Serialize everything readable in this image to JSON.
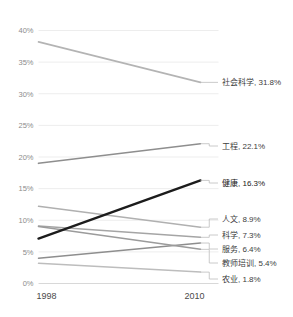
{
  "chart_data": {
    "type": "line",
    "subtype": "slope",
    "title": "",
    "subtitle": "",
    "xlabel": "",
    "ylabel": "",
    "x": [
      "1998",
      "2010"
    ],
    "categories": [
      "1998",
      "2010"
    ],
    "ylim": [
      0,
      40
    ],
    "grid": true,
    "legend_position": "right-labels",
    "y_ticks": [
      {
        "value": 40,
        "label": "40%"
      },
      {
        "value": 35,
        "label": "35%"
      },
      {
        "value": 30,
        "label": "30%"
      },
      {
        "value": 25,
        "label": "25%"
      },
      {
        "value": 20,
        "label": "20%"
      },
      {
        "value": 15,
        "label": "15%"
      },
      {
        "value": 10,
        "label": "10%"
      },
      {
        "value": 5,
        "label": "5%"
      },
      {
        "value": 0,
        "label": "0%"
      }
    ],
    "x_ticks": [
      {
        "label": "1998"
      },
      {
        "label": "2010"
      }
    ],
    "series": [
      {
        "name": "社会科学",
        "values": [
          38.2,
          31.8
        ],
        "end_label": "社会科学, 31.8%",
        "end_value_label": "31.8%",
        "color": "#b4b4b4",
        "width": 1.6,
        "highlight": false,
        "label_y": 82
      },
      {
        "name": "工程",
        "values": [
          19.0,
          22.1
        ],
        "end_label": "工程, 22.1%",
        "end_value_label": "22.1%",
        "color": "#8e8e8e",
        "width": 1.6,
        "highlight": false,
        "label_y": 146
      },
      {
        "name": "健康",
        "values": [
          7.1,
          16.3
        ],
        "end_label": "健康, 16.3%",
        "end_value_label": "16.3%",
        "color": "#1c1c1c",
        "width": 2.4,
        "highlight": true,
        "label_y": 183
      },
      {
        "name": "人文",
        "values": [
          12.2,
          8.9
        ],
        "end_label": "人文, 8.9%",
        "end_value_label": "8.9%",
        "color": "#b0b0b0",
        "width": 1.5,
        "highlight": false,
        "label_y": 219
      },
      {
        "name": "科学",
        "values": [
          9.1,
          7.3
        ],
        "end_label": "科学, 7.3%",
        "end_value_label": "7.3%",
        "color": "#a5a5a5",
        "width": 1.5,
        "highlight": false,
        "label_y": 235
      },
      {
        "name": "服务",
        "values": [
          4.0,
          6.4
        ],
        "end_label": "服务, 6.4%",
        "end_value_label": "6.4%",
        "color": "#8e8e8e",
        "width": 1.5,
        "highlight": false,
        "label_y": 249
      },
      {
        "name": "教师培训",
        "values": [
          9.0,
          5.4
        ],
        "end_label": "教师培训, 5.4%",
        "end_value_label": "5.4%",
        "color": "#9b9b9b",
        "width": 1.5,
        "highlight": false,
        "label_y": 263
      },
      {
        "name": "农业",
        "values": [
          3.2,
          1.8
        ],
        "end_label": "农业, 1.8%",
        "end_value_label": "1.8%",
        "color": "#bdbdbd",
        "width": 1.5,
        "highlight": false,
        "label_y": 279
      }
    ]
  },
  "colors": {
    "background": "#ffffff",
    "gridline": "#ededed",
    "baseline": "#d8d8d8",
    "tick_text": "#8c8c8c",
    "year_text": "#4a4a4a",
    "label_text": "#3d3d3d",
    "highlight_line": "#1c1c1c",
    "leader": "#bdbdbd"
  }
}
